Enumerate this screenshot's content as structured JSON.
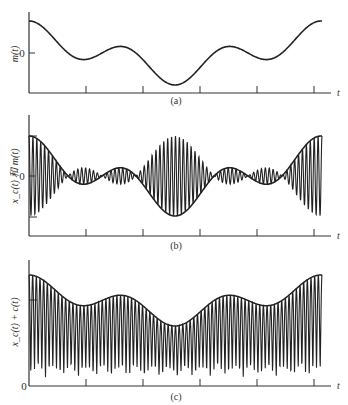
{
  "chart_data": [
    {
      "type": "line",
      "panel_label": "(a)",
      "ylabel": "m(t)",
      "xlabel": "t",
      "yticks": [
        "0"
      ],
      "x_ticks_count": 5,
      "description": "Message signal m(t): smooth baseband waveform, high at t=0, small dip, small bump, deep minimum at center, small bump, small dip, rising at end",
      "series": [
        {
          "name": "m(t)",
          "formula": "0.55*cos(u)+0.45*cos(3u), u from 0 to ~2pi"
        }
      ],
      "grid": false
    },
    {
      "type": "line",
      "panel_label": "(b)",
      "ylabel": "x_c(t) 和 m(t)",
      "xlabel": "t",
      "yticks": [
        "0"
      ],
      "x_ticks_count": 5,
      "description": "DSB-SC modulated signal x_c(t)=m(t)cos(wc t) overlaid with envelope m(t); carrier amplitude follows |m(t)| with phase reversals at zero crossings",
      "series": [
        {
          "name": "x_c(t)",
          "formula": "m(t)*cos(wc t), ~75 carrier cycles"
        },
        {
          "name": "m(t)",
          "formula": "same as panel (a)"
        }
      ],
      "grid": false
    },
    {
      "type": "line",
      "panel_label": "(c)",
      "ylabel": "x_c(t) + c(t)",
      "xlabel": "t",
      "yticks": [
        "0"
      ],
      "x_ticks_count": 5,
      "description": "DSB-SC signal plus carrier (AM with large carrier); envelope follows m(t) offset above zero, signal remains non-negative",
      "series": [
        {
          "name": "x_c(t)+c(t)",
          "formula": "(1+m(t))*(1+cos(wc t))/2 style, nonnegative"
        }
      ],
      "grid": false
    }
  ],
  "panels": {
    "a": {
      "caption": "(a)",
      "ylabel": "m(t)",
      "zero": "0",
      "t": "t"
    },
    "b": {
      "caption": "(b)",
      "ylabel": "x_c(t) 和 m(t)",
      "zero": "0",
      "t": "t"
    },
    "c": {
      "caption": "(c)",
      "ylabel": "x_c(t) + c(t)",
      "zero": "0",
      "t": "t"
    }
  }
}
